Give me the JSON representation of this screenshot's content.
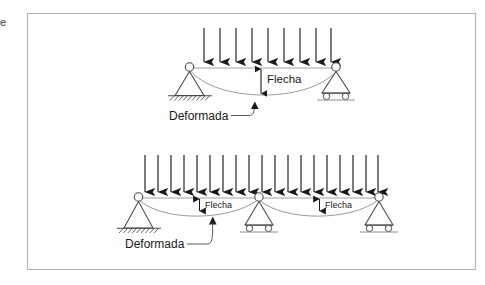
{
  "figure": {
    "border_color": "#b5b5b5",
    "background": "#ffffff",
    "edge_fragment_text": "e"
  },
  "style": {
    "beam_color": "#cfcfcf",
    "support_color": "#4a4a4a",
    "deformed_curve_color": "#9a9a9a",
    "arrow_color": "#1a1a1a",
    "dimension_color": "#1a1a1a",
    "ground_line_color": "#8a8a8a",
    "label_color": "#1a1a1a"
  },
  "diagrams": [
    {
      "id": "simply-supported-beam",
      "name": "Viga simplemente apoyada",
      "load": {
        "type": "distributed",
        "arrow_count": 9,
        "direction": "down"
      },
      "beam": {
        "x_start": 194,
        "x_end": 334,
        "y": 68,
        "span_label": ""
      },
      "supports": [
        {
          "kind": "pinned",
          "position": "left",
          "label": "apoyo-fijo"
        },
        {
          "kind": "roller",
          "position": "right",
          "label": "apoyo-movil"
        }
      ],
      "annotations": [
        {
          "key": "deflection",
          "text": "Flecha"
        },
        {
          "key": "deformed",
          "text": "Deformada"
        }
      ]
    },
    {
      "id": "two-span-continuous-beam",
      "name": "Viga continua de dos vanos",
      "load": {
        "type": "distributed",
        "arrow_count": 19,
        "direction": "down"
      },
      "beam": {
        "x_start": 139,
        "x_end": 379,
        "y": 198,
        "span_label": ""
      },
      "supports": [
        {
          "kind": "pinned",
          "position": "left",
          "label": "apoyo-fijo"
        },
        {
          "kind": "roller",
          "position": "middle",
          "label": "apoyo-movil-central"
        },
        {
          "kind": "roller",
          "position": "right",
          "label": "apoyo-movil-derecho"
        }
      ],
      "annotations": [
        {
          "key": "deflection-left",
          "text": "Flecha"
        },
        {
          "key": "deflection-right",
          "text": "Flecha"
        },
        {
          "key": "deformed",
          "text": "Deformada"
        }
      ]
    }
  ]
}
